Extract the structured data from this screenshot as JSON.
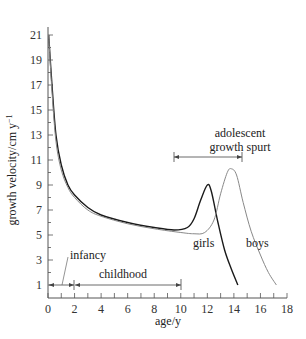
{
  "chart_data": {
    "type": "line",
    "title": "",
    "xlabel": "age/y",
    "ylabel": "growth velocity/cm y⁻¹",
    "xlim": [
      0,
      18
    ],
    "ylim": [
      1,
      21
    ],
    "x_ticks": [
      0,
      2,
      4,
      6,
      8,
      10,
      12,
      14,
      16,
      18
    ],
    "y_ticks": [
      1,
      3,
      5,
      7,
      9,
      11,
      13,
      15,
      17,
      19,
      21
    ],
    "grid": false,
    "legend": "inline labels",
    "series": [
      {
        "name": "girls",
        "color": "#1a1a1a",
        "x": [
          0.05,
          0.3,
          0.6,
          1.0,
          1.5,
          2.0,
          3.0,
          4.0,
          6.0,
          8.0,
          9.5,
          10.5,
          11.0,
          11.5,
          12.0,
          12.3,
          12.8,
          13.3,
          13.8,
          14.3
        ],
        "y": [
          21,
          17,
          13,
          10.6,
          9.0,
          8.2,
          7.2,
          6.6,
          6.0,
          5.6,
          5.4,
          5.6,
          6.3,
          7.8,
          9.0,
          8.5,
          6.0,
          3.8,
          2.3,
          1.0
        ]
      },
      {
        "name": "boys",
        "color": "#888888",
        "x": [
          0.05,
          0.3,
          0.6,
          1.0,
          1.5,
          2.0,
          3.0,
          4.0,
          6.0,
          8.0,
          10.0,
          11.0,
          11.8,
          12.5,
          13.0,
          13.5,
          13.8,
          14.2,
          14.7,
          15.3,
          16.0,
          16.6,
          17.2
        ],
        "y": [
          21,
          16.5,
          12.5,
          10.2,
          8.8,
          8.0,
          7.0,
          6.5,
          5.9,
          5.5,
          5.2,
          5.1,
          5.2,
          6.2,
          8.3,
          10.0,
          10.3,
          9.8,
          7.6,
          5.3,
          3.4,
          2.0,
          1.0
        ]
      }
    ],
    "annotations": [
      {
        "text": "infancy",
        "x_range": [
          0,
          2
        ],
        "y": 1
      },
      {
        "text": "childhood",
        "x_range": [
          2,
          10
        ],
        "y": 1
      },
      {
        "text": "adolescent growth spurt",
        "x_range": [
          9.5,
          15
        ],
        "y": 11.7
      },
      {
        "text": "girls",
        "x": 12.5,
        "y": 4
      },
      {
        "text": "boys",
        "x": 15.7,
        "y": 4
      }
    ]
  },
  "labels": {
    "xlabel": "age/y",
    "ylabel": "growth velocity/cm y",
    "ylabel_sup": "−1",
    "infancy": "infancy",
    "childhood": "childhood",
    "adolescent_line1": "adolescent",
    "adolescent_line2": "growth spurt",
    "girls": "girls",
    "boys": "boys"
  }
}
